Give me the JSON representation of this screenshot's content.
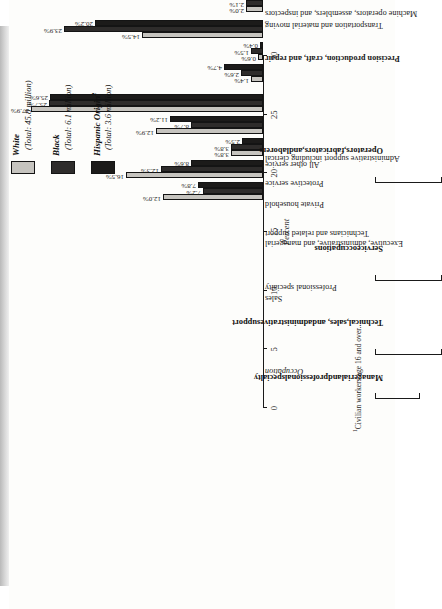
{
  "figure": {
    "axis_title": "Percent",
    "occupation_header": "Occupation",
    "footnote": "Civilian workers age 16 and over.",
    "footnote_marker": "1"
  },
  "legend": {
    "position": "right",
    "entries": [
      {
        "name": "White",
        "total": "(Total: 45.8 million)",
        "color": "#c6c4bf",
        "swatch": "white-swatch"
      },
      {
        "name": "Black",
        "total": "(Total: 6.1 million)",
        "color": "#2e2c2b",
        "swatch": "black-swatch"
      },
      {
        "name": "Hispanic Origin",
        "superscript": "2",
        "total": "(Total: 3.6 million)",
        "color": "#1c1b1a",
        "swatch": "hispanic-swatch"
      }
    ]
  },
  "groups": [
    {
      "label": "Managerial and professional specialty",
      "lines": [
        "Managerial",
        "and",
        "professional",
        "specialty"
      ]
    },
    {
      "label": "Technical, sales, and administrative support",
      "lines": [
        "Technical,",
        "sales, and",
        "administrative",
        "support"
      ]
    },
    {
      "label": "Service occupations",
      "lines": [
        "Service",
        "occupations"
      ]
    },
    {
      "label": "Operators, fabricators, and laborers",
      "lines": [
        "Operators,",
        "fabricators,",
        "and",
        "laborers"
      ]
    }
  ],
  "chart_data": {
    "type": "bar",
    "title": "Occupation",
    "xlabel": "Occupation",
    "ylabel": "Percent",
    "ylim": [
      0,
      30
    ],
    "yticks": [
      "0",
      "5",
      "10",
      "15",
      "20",
      "25",
      "30"
    ],
    "grid": false,
    "legend_position": "right",
    "orientation": "vertical-rotated",
    "categories": [
      "Executive, administrative, and managerial",
      "Professional specialty",
      "Technicians and related support",
      "Sales",
      "Administrative support including clerical",
      "Private household",
      "Protective service",
      "All other service",
      "Precision production, craft, and repair",
      "Machine operators, assemblers, and inspectors",
      "Transportation and material moving",
      "Handlers, equipment cleaners, helpers, and laborers",
      "Farming, forestry, and fishing"
    ],
    "category_styles": [
      "normal",
      "normal",
      "normal",
      "normal",
      "normal",
      "normal",
      "normal",
      "normal",
      "bold",
      "normal",
      "normal",
      "normal",
      "bold"
    ],
    "series": [
      {
        "name": "White",
        "values": [
          12.0,
          16.5,
          3.8,
          12.9,
          27.9,
          1.4,
          0.6,
          14.5,
          2.0,
          4.9,
          0.8,
          1.5,
          1.1
        ]
      },
      {
        "name": "Black",
        "values": [
          7.2,
          12.3,
          3.8,
          8.7,
          25.7,
          2.6,
          1.5,
          23.9,
          2.1,
          9.2,
          1.0,
          1.8,
          0.3
        ]
      },
      {
        "name": "Hispanic Origin",
        "values": [
          7.8,
          8.6,
          2.5,
          11.2,
          25.6,
          4.7,
          0.4,
          20.2,
          3.1,
          11.5,
          0.4,
          2.4,
          1.6
        ]
      }
    ],
    "value_labels": [
      [
        "12.0%",
        "7.2%",
        "7.8%"
      ],
      [
        "16.5%",
        "12.3%",
        "8.6%"
      ],
      [
        "3.8%",
        "3.8%",
        "2.5%"
      ],
      [
        "12.9%",
        "8.7%",
        "11.2%"
      ],
      [
        "27.9%",
        "25.7%",
        "25.6%"
      ],
      [
        "1.4%",
        "2.6%",
        "4.7%"
      ],
      [
        "0.6%",
        "1.5%",
        "0.4%"
      ],
      [
        "14.5%",
        "23.9%",
        "20.2%"
      ],
      [
        "2.0%",
        "2.1%",
        "3.1%"
      ],
      [
        "4.9%",
        "9.2%",
        "11.5%"
      ],
      [
        "0.8%",
        "1.0%",
        "0.4%"
      ],
      [
        "1.5%",
        "1.8%",
        "2.4%"
      ],
      [
        "1.1%",
        "0.3%",
        "1.6%"
      ]
    ]
  }
}
